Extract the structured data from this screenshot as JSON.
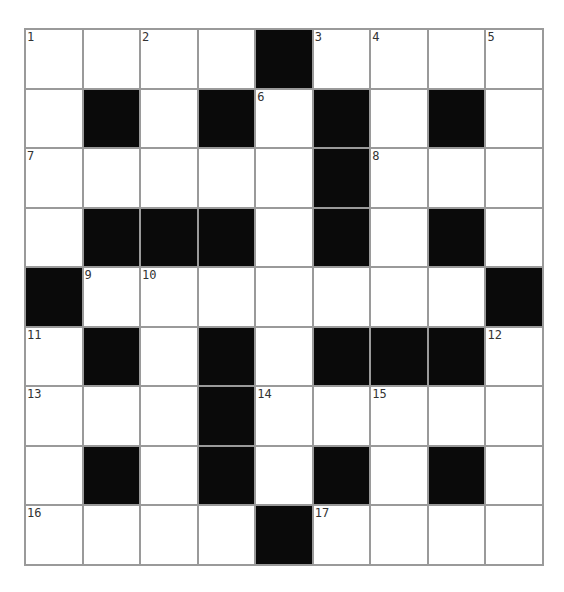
{
  "puzzle": {
    "rows": 9,
    "cols": 9,
    "grid": [
      [
        "1",
        ".",
        "2",
        ".",
        "#",
        "3",
        "4",
        ".",
        "5"
      ],
      [
        ".",
        "#",
        ".",
        "#",
        "6",
        "#",
        ".",
        "#",
        "."
      ],
      [
        "7",
        ".",
        ".",
        ".",
        ".",
        "#",
        "8",
        ".",
        "."
      ],
      [
        ".",
        "#",
        "#",
        "#",
        ".",
        "#",
        ".",
        "#",
        "."
      ],
      [
        "#",
        "9",
        "10",
        ".",
        ".",
        ".",
        ".",
        ".",
        "#"
      ],
      [
        "11",
        "#",
        ".",
        "#",
        ".",
        "#",
        "#",
        "#",
        "12"
      ],
      [
        "13",
        ".",
        ".",
        "#",
        "14",
        ".",
        "15",
        ".",
        "."
      ],
      [
        ".",
        "#",
        ".",
        "#",
        ".",
        "#",
        ".",
        "#",
        "."
      ],
      [
        "16",
        ".",
        ".",
        ".",
        "#",
        "17",
        ".",
        ".",
        "."
      ]
    ],
    "legend": {
      "#": "black-square",
      ".": "empty-white-square",
      "number": "numbered-white-square"
    },
    "colors": {
      "grid_line": "#9a9a9a",
      "black_square": "#0a0a0a",
      "white_square": "#ffffff",
      "number_text": "#333333"
    }
  }
}
